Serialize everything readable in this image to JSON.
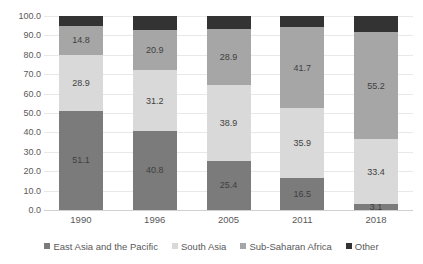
{
  "chart_data": {
    "type": "bar",
    "stacked": true,
    "title": "",
    "subtitle": "",
    "xlabel": "",
    "ylabel": "",
    "categories": [
      "1990",
      "1996",
      "2005",
      "2011",
      "2018"
    ],
    "ylim": [
      0,
      100
    ],
    "ytick_labels": [
      "100.0",
      "90.0",
      "80.0",
      "70.0",
      "60.0",
      "50.0",
      "40.0",
      "30.0",
      "20.0",
      "10.0",
      "0.0"
    ],
    "ytick_values": [
      100,
      90,
      80,
      70,
      60,
      50,
      40,
      30,
      20,
      10,
      0
    ],
    "grid": true,
    "legend_position": "bottom",
    "series": [
      {
        "name": "East Asia and the Pacific",
        "color": "#7b7b7b",
        "values": [
          51.1,
          40.8,
          25.4,
          16.5,
          3.1
        ],
        "labels": [
          "51.1",
          "40.8",
          "25.4",
          "16.5",
          "3.1"
        ]
      },
      {
        "name": "South Asia",
        "color": "#d9d9d9",
        "values": [
          28.9,
          31.2,
          38.9,
          35.9,
          33.4
        ],
        "labels": [
          "28.9",
          "31.2",
          "38.9",
          "35.9",
          "33.4"
        ]
      },
      {
        "name": "Sub-Saharan Africa",
        "color": "#a6a6a6",
        "values": [
          14.8,
          20.9,
          28.9,
          41.7,
          55.2
        ],
        "labels": [
          "14.8",
          "20.9",
          "28.9",
          "41.7",
          "55.2"
        ]
      },
      {
        "name": "Other",
        "color": "#333333",
        "values": [
          5.2,
          7.1,
          6.8,
          5.9,
          8.3
        ],
        "labels": [
          "",
          "",
          "",
          "",
          ""
        ]
      }
    ]
  },
  "legend": {
    "items": [
      {
        "label": "East Asia and the Pacific",
        "color": "#7b7b7b"
      },
      {
        "label": "South Asia",
        "color": "#d9d9d9"
      },
      {
        "label": "Sub-Saharan Africa",
        "color": "#a6a6a6"
      },
      {
        "label": "Other",
        "color": "#333333"
      }
    ]
  }
}
